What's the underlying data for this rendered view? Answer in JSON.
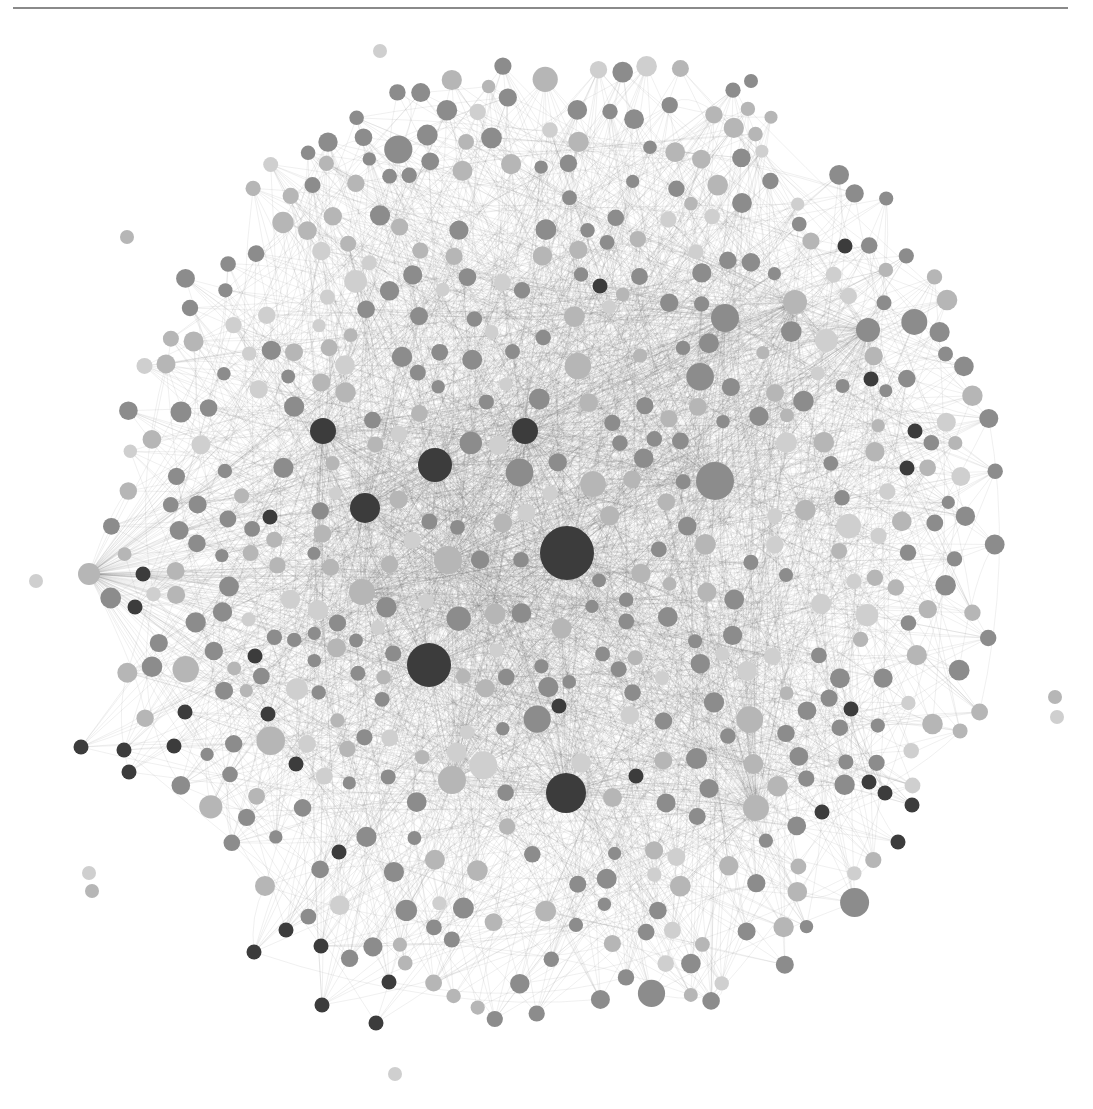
{
  "figure": {
    "type": "network-graph",
    "background": "#ffffff",
    "rule_color": "#8a8a8a",
    "edge_color": "#707070",
    "palette": {
      "dark": "#3c3c3c",
      "mid": "#8c8c8c",
      "light": "#b6b6b6",
      "pale": "#cfcfcf"
    }
  },
  "chart_data": {
    "type": "network",
    "title": "",
    "layout": "force-directed",
    "center": [
      560,
      560
    ],
    "radius": 470,
    "hubs": [
      {
        "x": 567,
        "y": 553,
        "r": 27,
        "tone": "dark"
      },
      {
        "x": 429,
        "y": 665,
        "r": 22,
        "tone": "dark"
      },
      {
        "x": 566,
        "y": 793,
        "r": 20,
        "tone": "dark"
      },
      {
        "x": 435,
        "y": 465,
        "r": 17,
        "tone": "dark"
      },
      {
        "x": 365,
        "y": 508,
        "r": 15,
        "tone": "dark"
      },
      {
        "x": 323,
        "y": 431,
        "r": 13,
        "tone": "dark"
      },
      {
        "x": 525,
        "y": 431,
        "r": 13,
        "tone": "dark"
      },
      {
        "x": 715,
        "y": 481,
        "r": 19,
        "tone": "mid"
      },
      {
        "x": 725,
        "y": 318,
        "r": 14,
        "tone": "mid"
      },
      {
        "x": 448,
        "y": 560,
        "r": 14,
        "tone": "light"
      },
      {
        "x": 362,
        "y": 592,
        "r": 13,
        "tone": "light"
      },
      {
        "x": 452,
        "y": 780,
        "r": 14,
        "tone": "light"
      },
      {
        "x": 756,
        "y": 808,
        "r": 13,
        "tone": "light"
      },
      {
        "x": 795,
        "y": 302,
        "r": 12,
        "tone": "light"
      },
      {
        "x": 868,
        "y": 330,
        "r": 12,
        "tone": "mid"
      },
      {
        "x": 89,
        "y": 574,
        "r": 11,
        "tone": "light"
      }
    ],
    "dark_nodes": [
      [
        135,
        607
      ],
      [
        143,
        574
      ],
      [
        270,
        517
      ],
      [
        255,
        656
      ],
      [
        185,
        712
      ],
      [
        268,
        714
      ],
      [
        174,
        746
      ],
      [
        81,
        747
      ],
      [
        124,
        750
      ],
      [
        129,
        772
      ],
      [
        296,
        764
      ],
      [
        339,
        852
      ],
      [
        286,
        930
      ],
      [
        254,
        952
      ],
      [
        321,
        946
      ],
      [
        389,
        982
      ],
      [
        322,
        1005
      ],
      [
        376,
        1023
      ],
      [
        559,
        706
      ],
      [
        636,
        776
      ],
      [
        600,
        286
      ],
      [
        845,
        246
      ],
      [
        871,
        379
      ],
      [
        915,
        431
      ],
      [
        907,
        468
      ],
      [
        851,
        709
      ],
      [
        869,
        782
      ],
      [
        885,
        793
      ],
      [
        822,
        812
      ],
      [
        912,
        805
      ],
      [
        898,
        842
      ]
    ],
    "outliers": [
      {
        "x": 380,
        "y": 51,
        "r": 7,
        "tone": "pale"
      },
      {
        "x": 751,
        "y": 81,
        "r": 7,
        "tone": "mid"
      },
      {
        "x": 36,
        "y": 581,
        "r": 7,
        "tone": "pale"
      },
      {
        "x": 1055,
        "y": 697,
        "r": 7,
        "tone": "light"
      },
      {
        "x": 1057,
        "y": 717,
        "r": 7,
        "tone": "pale"
      },
      {
        "x": 89,
        "y": 873,
        "r": 7,
        "tone": "pale"
      },
      {
        "x": 92,
        "y": 891,
        "r": 7,
        "tone": "light"
      },
      {
        "x": 395,
        "y": 1074,
        "r": 7,
        "tone": "pale"
      },
      {
        "x": 127,
        "y": 237,
        "r": 7,
        "tone": "light"
      }
    ],
    "approx_node_count": 520,
    "legend": null,
    "labels": []
  }
}
